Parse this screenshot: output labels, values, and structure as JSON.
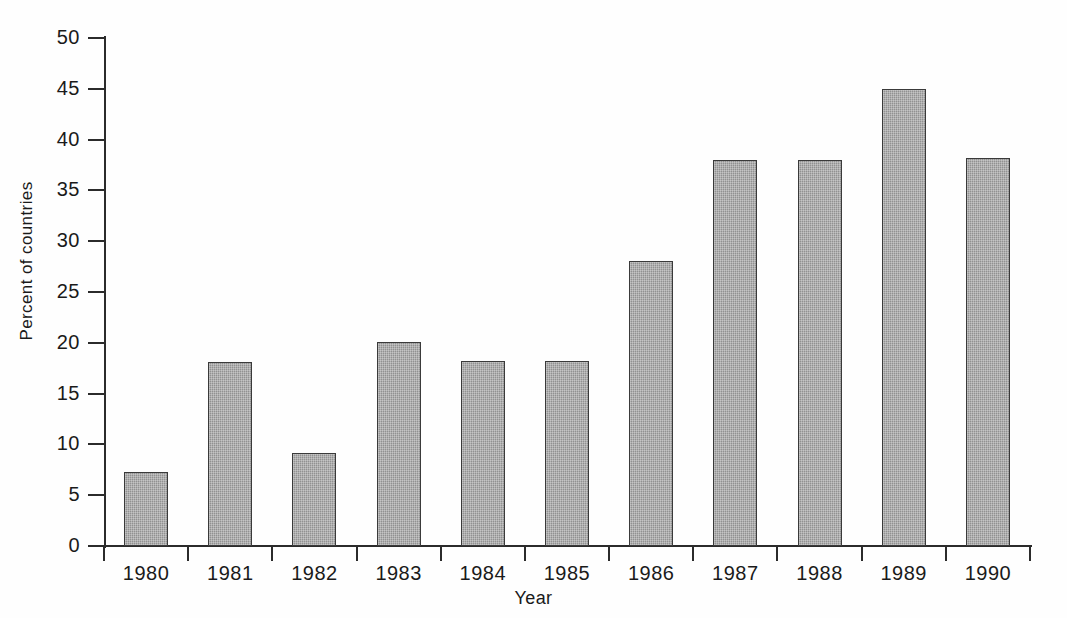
{
  "chart_data": {
    "type": "bar",
    "title": "",
    "xlabel": "Year",
    "ylabel": "Percent of countries",
    "categories": [
      "1980",
      "1981",
      "1982",
      "1983",
      "1984",
      "1985",
      "1986",
      "1987",
      "1988",
      "1989",
      "1990"
    ],
    "values": [
      7.3,
      18.1,
      9.2,
      20.1,
      18.2,
      18.2,
      28.1,
      38.0,
      38.0,
      45.0,
      38.2
    ],
    "ylim": [
      0,
      50
    ],
    "ytick_values": [
      0,
      5,
      10,
      15,
      20,
      25,
      30,
      35,
      40,
      45,
      50
    ],
    "ytick_labels": [
      "0",
      "5",
      "10",
      "15",
      "20",
      "25",
      "30",
      "35",
      "40",
      "45",
      "50"
    ],
    "grid": false,
    "legend": null,
    "legend_position": "none",
    "bar_fill_color": "#9a9a9a",
    "bar_border_color": "#3a3a3a",
    "axis_color": "#2b2b2b",
    "background_color": "#fefefe"
  },
  "axes": {
    "y_title": "Percent of countries",
    "x_title": "Year"
  }
}
